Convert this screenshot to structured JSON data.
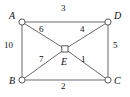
{
  "figure": {
    "kind": "weighted-graph-diagram",
    "background_color": "#ffffff",
    "stroke_color": "#5a5a5a",
    "text_color": "#111111"
  },
  "vertices": [
    {
      "id": "A",
      "label": "A",
      "x": 22,
      "y": 22,
      "shape": "circle"
    },
    {
      "id": "D",
      "label": "D",
      "x": 108,
      "y": 22,
      "shape": "circle"
    },
    {
      "id": "B",
      "label": "B",
      "x": 22,
      "y": 80,
      "shape": "circle"
    },
    {
      "id": "C",
      "label": "C",
      "x": 108,
      "y": 80,
      "shape": "circle"
    },
    {
      "id": "E",
      "label": "E",
      "x": 65,
      "y": 49,
      "shape": "square"
    }
  ],
  "edges": [
    {
      "id": "AD",
      "from": "A",
      "to": "D",
      "weight": "3"
    },
    {
      "id": "AB",
      "from": "A",
      "to": "B",
      "weight": "10"
    },
    {
      "id": "BC",
      "from": "B",
      "to": "C",
      "weight": "2"
    },
    {
      "id": "DC",
      "from": "D",
      "to": "C",
      "weight": "5"
    },
    {
      "id": "AE",
      "from": "A",
      "to": "E",
      "weight": "6"
    },
    {
      "id": "DE",
      "from": "D",
      "to": "E",
      "weight": "4"
    },
    {
      "id": "BE",
      "from": "B",
      "to": "E",
      "weight": "7"
    },
    {
      "id": "CE",
      "from": "C",
      "to": "E",
      "weight": "1"
    }
  ]
}
